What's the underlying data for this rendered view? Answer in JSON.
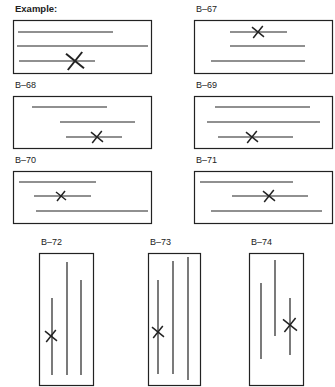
{
  "figure": {
    "type": "line-crossing diagrams",
    "stroke_color": "#222222",
    "background": "#ffffff"
  },
  "panels": [
    {
      "id": "example",
      "label": "Example:",
      "orientation": "horizontal",
      "label_pos": [
        15,
        4
      ],
      "box": [
        13,
        20,
        138,
        53
      ],
      "lines": [
        [
          18,
          32,
          113,
          32
        ],
        [
          17,
          46,
          148,
          46
        ],
        [
          19,
          61,
          95,
          61
        ]
      ],
      "x_mark": {
        "cx": 75,
        "cy": 61,
        "size": 9
      }
    },
    {
      "id": "b-67",
      "label": "B–67",
      "orientation": "horizontal",
      "label_pos": [
        196,
        4
      ],
      "box": [
        194,
        20,
        138,
        53
      ],
      "lines": [
        [
          230,
          32,
          287,
          32
        ],
        [
          230,
          46,
          305,
          46
        ],
        [
          211,
          61,
          305,
          61
        ]
      ],
      "x_mark": {
        "cx": 258,
        "cy": 32,
        "size": 6
      }
    },
    {
      "id": "b-68",
      "label": "B–68",
      "orientation": "horizontal",
      "label_pos": [
        15,
        80
      ],
      "box": [
        13,
        96,
        138,
        52
      ],
      "lines": [
        [
          32,
          107,
          107,
          107
        ],
        [
          60,
          122,
          135,
          122
        ],
        [
          66,
          137,
          122,
          137
        ]
      ],
      "x_mark": {
        "cx": 97,
        "cy": 137,
        "size": 6
      }
    },
    {
      "id": "b-69",
      "label": "B–69",
      "orientation": "horizontal",
      "label_pos": [
        196,
        80
      ],
      "box": [
        194,
        96,
        138,
        52
      ],
      "lines": [
        [
          215,
          107,
          310,
          107
        ],
        [
          207,
          122,
          320,
          122
        ],
        [
          218,
          137,
          293,
          137
        ]
      ],
      "x_mark": {
        "cx": 252,
        "cy": 137,
        "size": 6
      }
    },
    {
      "id": "b-70",
      "label": "B–70",
      "orientation": "horizontal",
      "label_pos": [
        15,
        155
      ],
      "box": [
        13,
        171,
        138,
        52
      ],
      "lines": [
        [
          19,
          182,
          96,
          182
        ],
        [
          34,
          196,
          91,
          196
        ],
        [
          36,
          211,
          148,
          211
        ]
      ],
      "x_mark": {
        "cx": 61,
        "cy": 196,
        "size": 5
      }
    },
    {
      "id": "b-71",
      "label": "B–71",
      "orientation": "horizontal",
      "label_pos": [
        196,
        155
      ],
      "box": [
        194,
        171,
        138,
        52
      ],
      "lines": [
        [
          200,
          182,
          293,
          182
        ],
        [
          232,
          196,
          308,
          196
        ],
        [
          211,
          211,
          322,
          211
        ]
      ],
      "x_mark": {
        "cx": 269,
        "cy": 196,
        "size": 6
      }
    },
    {
      "id": "b-72",
      "label": "B–72",
      "orientation": "vertical",
      "label_pos": [
        41,
        237
      ],
      "box": [
        39,
        253,
        54,
        132
      ],
      "lines": [
        [
          52,
          298,
          52,
          375
        ],
        [
          67,
          262,
          67,
          375
        ],
        [
          81,
          280,
          81,
          375
        ]
      ],
      "x_mark": {
        "cx": 51,
        "cy": 336,
        "size": 6
      }
    },
    {
      "id": "b-73",
      "label": "B–73",
      "orientation": "vertical",
      "label_pos": [
        150,
        237
      ],
      "box": [
        148,
        253,
        52,
        132
      ],
      "lines": [
        [
          158,
          280,
          158,
          374
        ],
        [
          173,
          261,
          173,
          374
        ],
        [
          188,
          257,
          188,
          380
        ]
      ],
      "x_mark": {
        "cx": 158,
        "cy": 332,
        "size": 6
      }
    },
    {
      "id": "b-74",
      "label": "B–74",
      "orientation": "vertical",
      "label_pos": [
        251,
        237
      ],
      "box": [
        249,
        253,
        54,
        132
      ],
      "lines": [
        [
          261,
          283,
          261,
          359
        ],
        [
          275,
          260,
          275,
          336
        ],
        [
          290,
          298,
          290,
          355
        ]
      ],
      "x_mark": {
        "cx": 290,
        "cy": 325,
        "size": 7
      }
    }
  ]
}
